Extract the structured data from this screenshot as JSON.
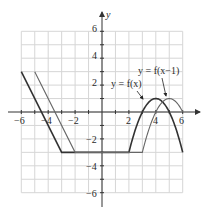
{
  "chart_data": {
    "type": "line",
    "title": "",
    "xlabel": "",
    "ylabel": "y",
    "xlim": [
      -6,
      6
    ],
    "ylim": [
      -6,
      6
    ],
    "grid": true,
    "x_ticks": [
      -6,
      -4,
      -2,
      2,
      4,
      6
    ],
    "x_tick_labels": [
      "−6",
      "−4",
      "−2",
      "2",
      "4",
      "6"
    ],
    "y_ticks": [
      6,
      4,
      2,
      -2,
      -4,
      -6
    ],
    "y_tick_labels": [
      "6",
      "4",
      "2",
      "−2",
      "−4",
      "−6"
    ],
    "series": [
      {
        "name": "y = f(x)",
        "color": "#333333",
        "description": "line from (-6,3) to (-3,-3); horizontal y=-3 from x=-3 to 2; parabola y=-(x-4)^2+1 from x=2 to 6",
        "points": [
          [
            -6,
            3
          ],
          [
            -3,
            -3
          ],
          [
            2,
            -3
          ],
          [
            3,
            0
          ],
          [
            4,
            1
          ],
          [
            5,
            0
          ],
          [
            6,
            -3
          ]
        ]
      },
      {
        "name": "y = f(x−1)",
        "color": "#555555",
        "description": "f(x) shifted right by 1: line from (-5,3) to (-2,-3); horizontal y=-3 from x=-2 to 3; parabola y=-(x-5)^2+1 from x=3 to 6",
        "points": [
          [
            -5,
            3
          ],
          [
            -2,
            -3
          ],
          [
            3,
            -3
          ],
          [
            4,
            0
          ],
          [
            5,
            1
          ],
          [
            6,
            0
          ]
        ]
      }
    ],
    "annotations": [
      {
        "text": "y = f(x)",
        "arrow_to": [
          3.0,
          0.2
        ]
      },
      {
        "text": "y = f(x−1)",
        "arrow_to": [
          4.8,
          1.0
        ]
      }
    ]
  },
  "labels": {
    "y_axis": "y",
    "fx": "y = f(x)",
    "fx1": "y = f(x−1)",
    "xt_m6": "−6",
    "xt_m4": "−4",
    "xt_m2": "−2",
    "xt_2": "2",
    "xt_4": "4",
    "xt_6": "6",
    "yt_6": "6",
    "yt_4": "4",
    "yt_2": "2",
    "yt_m2": "−2",
    "yt_m4": "−4",
    "yt_m6": "−6"
  }
}
